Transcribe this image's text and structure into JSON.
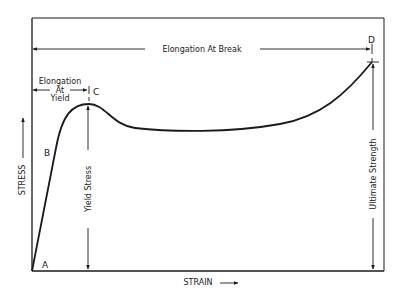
{
  "diagram": {
    "type": "stress-strain-curve",
    "axes": {
      "x_label": "STRAIN",
      "y_label": "STRESS"
    },
    "points": {
      "A": "A",
      "B": "B",
      "C": "C",
      "D": "D"
    },
    "annotations": {
      "elongation_at_break": "Elongation At Break",
      "elongation_at_yield_line1": "Elongation",
      "elongation_at_yield_line2": "At",
      "elongation_at_yield_line3": "Yield",
      "yield_stress": "Yield Stress",
      "ultimate_strength": "Ultimate Strength"
    },
    "colors": {
      "line": "#1a1a1a",
      "background": "#ffffff"
    }
  }
}
